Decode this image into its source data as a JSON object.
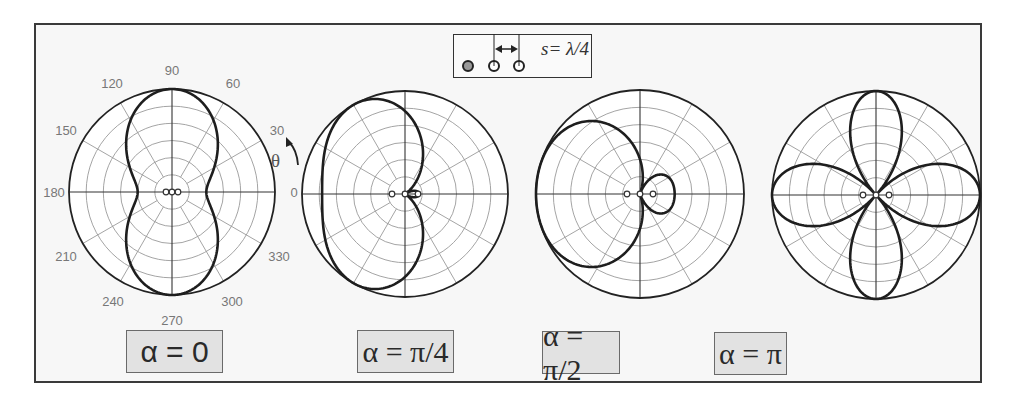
{
  "figure": {
    "inset": {
      "label": "s= λ/4",
      "element_count": 3
    },
    "angle_labels": [
      "0",
      "30",
      "60",
      "90",
      "120",
      "150",
      "180",
      "210",
      "240",
      "270",
      "300",
      "330"
    ],
    "theta_symbol": "θ",
    "plots": [
      {
        "alpha_label": "α = 0",
        "alpha": "0"
      },
      {
        "alpha_label": "α = π/4",
        "alpha": "π/4"
      },
      {
        "alpha_label": "α = π/2",
        "alpha": "π/2"
      },
      {
        "alpha_label": "α = π",
        "alpha": "π"
      }
    ]
  },
  "chart_data": [
    {
      "type": "polar",
      "title": "α = 0",
      "description": "Array factor of 3-element linear array, spacing s = λ/4, progressive phase α = 0",
      "angle_ticks_deg": [
        0,
        30,
        60,
        90,
        120,
        150,
        180,
        210,
        240,
        270,
        300,
        330
      ],
      "radial_rings": 6,
      "pattern": "broadside figure-eight, maxima at 90° and 270°, nulls near 0° and 180°",
      "maxima_deg": [
        90,
        270
      ],
      "normalized_max": 1.0
    },
    {
      "type": "polar",
      "title": "α = π/4",
      "angle_ticks_deg": [
        0,
        30,
        60,
        90,
        120,
        150,
        180,
        210,
        240,
        270,
        300,
        330
      ],
      "radial_rings": 6,
      "pattern": "main lobe toward 180°, wide beam spanning ~110°–250°, small lobe near 0°",
      "maxima_deg": [
        180
      ],
      "normalized_max": 1.0
    },
    {
      "type": "polar",
      "title": "α = π/2",
      "angle_ticks_deg": [
        0,
        30,
        60,
        90,
        120,
        150,
        180,
        210,
        240,
        270,
        300,
        330
      ],
      "radial_rings": 6,
      "pattern": "endfire main lobe toward 180°, small back lobe toward 0° (≈0.33)",
      "maxima_deg": [
        180
      ],
      "back_lobe_relative": 0.33,
      "normalized_max": 1.0
    },
    {
      "type": "polar",
      "title": "α = π",
      "angle_ticks_deg": [
        0,
        30,
        60,
        90,
        120,
        150,
        180,
        210,
        240,
        270,
        300,
        330
      ],
      "radial_rings": 6,
      "pattern": "four-lobed pattern, maxima at 0°, 90°, 180°, 270°; nulls near ±~50°",
      "maxima_deg": [
        0,
        90,
        180,
        270
      ],
      "normalized_max": 1.0
    }
  ]
}
